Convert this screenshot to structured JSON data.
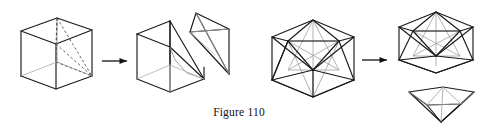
{
  "figure": {
    "caption": "Figure 110",
    "background_color": "#ffffff",
    "stroke_color": "#1a1a1a",
    "hidden_stroke_color": "#8a8a8a",
    "interior_stroke_color": "#777777",
    "panels": [
      {
        "id": "cube-dissection",
        "label": "cube dissection",
        "shapes": [
          {
            "name": "cube-solid",
            "kind": "cube",
            "description": "wireframe cube with dashed interior cutting lines from top-front vertex"
          },
          {
            "name": "cube-piece-large",
            "kind": "cut-cube-remainder",
            "description": "cube with a corner tetrahedron removed"
          },
          {
            "name": "cube-piece-tetrahedron",
            "kind": "tetrahedron",
            "description": "detached tetrahedral corner piece"
          }
        ],
        "arrow": {
          "name": "transform-arrow-left",
          "direction": "right"
        }
      },
      {
        "id": "icosahedron-dissection",
        "label": "icosahedron dissection",
        "shapes": [
          {
            "name": "icosahedron-solid",
            "kind": "icosahedron",
            "description": "full icosahedron wireframe"
          },
          {
            "name": "icosahedron-piece-body",
            "kind": "icosahedron-minus-cap",
            "description": "icosahedron with bottom pentagonal pyramid removed"
          },
          {
            "name": "icosahedron-piece-cap",
            "kind": "pentagonal-pyramid",
            "description": "detached pentagonal pyramid cap"
          }
        ],
        "arrow": {
          "name": "transform-arrow-right",
          "direction": "right"
        }
      }
    ]
  }
}
